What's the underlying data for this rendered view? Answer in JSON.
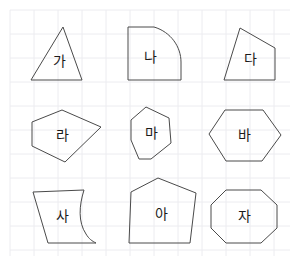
{
  "page": {
    "width": 297,
    "height": 267,
    "background_color": "#ffffff",
    "stroke_color": "#4a4a4a",
    "label_color": "#1b1b1b"
  },
  "grid": {
    "line_color": "#ececf0",
    "cell_size": 24,
    "origin_x": 10,
    "origin_y": 10,
    "extent_x": 290,
    "extent_y": 256,
    "visible": true
  },
  "shapes": [
    {
      "id": "shape-ga",
      "label": "가",
      "kind": "triangle",
      "row": 1,
      "column": 1,
      "sides": 3,
      "label_x": 59,
      "label_y": 61,
      "path": "M 63 27 L 82 80 L 31 80 Z"
    },
    {
      "id": "shape-na",
      "label": "나",
      "kind": "quarter-round-shape",
      "row": 1,
      "column": 2,
      "sides": 3,
      "label_x": 150,
      "label_y": 57,
      "path": "M 128 27 L 154 27 C 171 32 181 47 181 62 L 181 80 L 128 80 Z"
    },
    {
      "id": "shape-da",
      "label": "다",
      "kind": "quadrilateral",
      "row": 1,
      "column": 3,
      "sides": 4,
      "label_x": 250,
      "label_y": 59,
      "path": "M 240 28 L 275 48 L 275 80 L 224 80 Z"
    },
    {
      "id": "shape-ra",
      "label": "라",
      "kind": "pentagon",
      "row": 2,
      "column": 1,
      "sides": 5,
      "label_x": 62,
      "label_y": 135,
      "path": "M 62 110 L 101 127 L 65 162 L 32 146 L 32 122 Z"
    },
    {
      "id": "shape-ma",
      "label": "마",
      "kind": "heptagon",
      "row": 2,
      "column": 2,
      "sides": 7,
      "label_x": 151,
      "label_y": 133,
      "path": "M 146 107 L 169 118 L 171 143 L 151 159 L 139 159 L 131 140 L 131 120 Z"
    },
    {
      "id": "shape-ba",
      "label": "바",
      "kind": "hexagon",
      "row": 2,
      "column": 3,
      "sides": 6,
      "label_x": 244,
      "label_y": 135,
      "path": "M 225 110 L 263 110 L 281 135 L 262 161 L 226 161 L 209 134 Z"
    },
    {
      "id": "shape-sa",
      "label": "사",
      "kind": "concave-curved-quadrilateral",
      "row": 3,
      "column": 1,
      "sides": 4,
      "label_x": 62,
      "label_y": 216,
      "path": "M 33 192 L 84 190 C 79 206 78 222 86 234 C 89 239 92 241 96 243 L 48 243 Z"
    },
    {
      "id": "shape-a",
      "label": "아",
      "kind": "pentagon",
      "row": 3,
      "column": 2,
      "sides": 5,
      "label_x": 161,
      "label_y": 214,
      "path": "M 158 178 L 196 193 L 190 243 L 129 243 L 131 192 Z"
    },
    {
      "id": "shape-ja",
      "label": "자",
      "kind": "octagon",
      "row": 3,
      "column": 3,
      "sides": 8,
      "label_x": 244,
      "label_y": 216,
      "path": "M 226 190 L 261 190 L 277 205 L 277 228 L 261 243 L 226 243 L 211 228 L 211 205 Z"
    }
  ]
}
